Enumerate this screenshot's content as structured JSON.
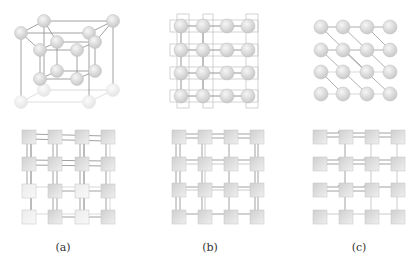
{
  "figure": {
    "panels": [
      {
        "id": "a",
        "label": "(a)",
        "description": "3D cubic lattice of spheres (top) with corresponding tile grid with long-range couplings (bottom)"
      },
      {
        "id": "b",
        "label": "(b)",
        "description": "2D square lattice of spheres with nearest-neighbour couplings (top) and tile grid with double-line couplings (bottom)"
      },
      {
        "id": "c",
        "label": "(c)",
        "description": "2D lattice with diagonal couplings (top) and tile grid with diagonal connectors (bottom)"
      }
    ],
    "colors": {
      "node_fill": "#d9d9d9",
      "node_highlight": "#f4f4f4",
      "node_faded": "#efefef",
      "edge": "#8a8a8a",
      "edge_light": "#c8c8c8",
      "tile_fill": "#dcdcdc",
      "label": "#333333"
    }
  }
}
